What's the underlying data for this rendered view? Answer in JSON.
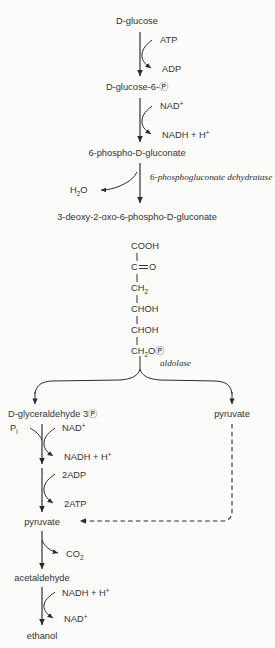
{
  "diagram": {
    "colors": {
      "background": "#fbfbfa",
      "stroke": "#2b2b2b",
      "text": "#333333"
    },
    "metabolites": {
      "glucose": "D-glucose",
      "glucose6p": "D-glucose-6-Ⓟ",
      "phosphogluconate": "6-phospho-D-gluconate",
      "kdpg": "3-deoxy-2-oxo-6-phospho-D-gluconate",
      "g3p": "D-glyceraldehyde 3Ⓟ",
      "pyruvate_right": "pyruvate",
      "pyruvate_left": "pyruvate",
      "acetaldehyde": "acetaldehyde",
      "ethanol": "ethanol"
    },
    "cofactors": {
      "atp_in": "ATP",
      "adp_out": "ADP",
      "nad_in_1": "NAD",
      "nadh_out_1": "NADH + H",
      "water_out": "H",
      "water_sub": "2",
      "water_tail": "O",
      "pi_in": "P",
      "pi_sub": "i",
      "nad_in_2": "NAD",
      "nadh_out_2": "NADH + H",
      "adp2_in": "2ADP",
      "atp2_out": "2ATP",
      "co2_out": "CO",
      "co2_sub": "2",
      "nadh_in_3": "NADH + H",
      "nad_out_3": "NAD",
      "plus": "+"
    },
    "enzymes": {
      "dehydratase": "6-phosphogluconate dehydratase",
      "aldolase": "aldolase"
    },
    "structure": {
      "caption": "open-chain structure of 3-deoxy-2-oxo-6-phospho-D-gluconate",
      "lines": [
        {
          "text": "COOH",
          "x": 130,
          "y": 250
        },
        {
          "text": "C",
          "x": 130,
          "y": 268,
          "double_bond_to": "O"
        },
        {
          "text": "CH",
          "x": 130,
          "y": 286,
          "sub": "2"
        },
        {
          "text": "CHOH",
          "x": 130,
          "y": 304
        },
        {
          "text": "CHOH",
          "x": 130,
          "y": 322
        },
        {
          "text": "CH",
          "x": 130,
          "y": 340,
          "sub": "2",
          "tail": "OⓅ"
        }
      ],
      "c2_oxygen": "O",
      "ch2_sub": "2",
      "phosphate_glyph": "Ⓟ"
    }
  }
}
